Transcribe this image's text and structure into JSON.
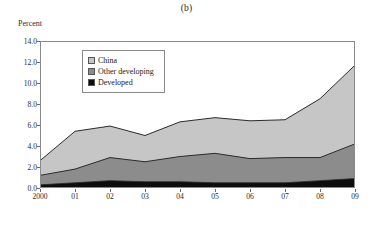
{
  "figure": {
    "panel_title": "(b)",
    "y_axis_title": "Percent"
  },
  "legend": {
    "items": [
      {
        "label": "China",
        "color": "#c6c6c6"
      },
      {
        "label": "Other developing",
        "color": "#8c8c8c"
      },
      {
        "label": "Developed",
        "color": "#0d0d0d"
      }
    ]
  },
  "axes": {
    "y_ticks": [
      "0.0",
      "2.0",
      "4.0",
      "6.0",
      "8.0",
      "10.0",
      "12.0",
      "14.0"
    ],
    "x_ticks": [
      "2000",
      "01",
      "02",
      "03",
      "04",
      "05",
      "06",
      "07",
      "08",
      "09"
    ]
  },
  "chart_data": {
    "type": "area",
    "stacked": true,
    "title": "(b)",
    "xlabel": "",
    "ylabel": "Percent",
    "ylim": [
      0.0,
      14.0
    ],
    "y_tick_step": 2.0,
    "grid": false,
    "legend_position": "inside-top-left",
    "categories": [
      "2000",
      "01",
      "02",
      "03",
      "04",
      "05",
      "06",
      "07",
      "08",
      "09"
    ],
    "series": [
      {
        "name": "Developed",
        "color": "#0d0d0d",
        "values": [
          0.3,
          0.5,
          0.7,
          0.6,
          0.6,
          0.5,
          0.5,
          0.5,
          0.7,
          0.9
        ]
      },
      {
        "name": "Other developing",
        "color": "#8c8c8c",
        "values": [
          0.9,
          1.3,
          2.2,
          1.9,
          2.4,
          2.8,
          2.3,
          2.4,
          2.2,
          3.3
        ]
      },
      {
        "name": "China",
        "color": "#c6c6c6",
        "values": [
          1.4,
          3.6,
          3.0,
          2.5,
          3.3,
          3.4,
          3.6,
          3.6,
          5.6,
          7.5
        ]
      }
    ],
    "cumulative_totals": [
      2.6,
      5.4,
      5.9,
      5.0,
      6.3,
      6.7,
      6.4,
      6.5,
      8.5,
      11.7
    ]
  }
}
